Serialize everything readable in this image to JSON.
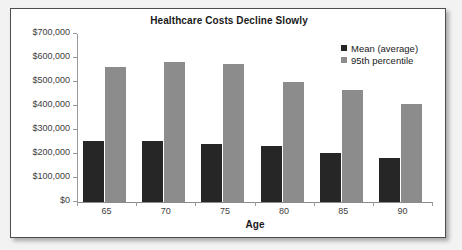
{
  "chart_data": {
    "type": "bar",
    "title": "Healthcare Costs Decline Slowly",
    "xlabel": "Age",
    "ylabel": "",
    "categories": [
      "65",
      "70",
      "75",
      "80",
      "85",
      "90"
    ],
    "series": [
      {
        "name": "Mean (average)",
        "color": "#262626",
        "values": [
          253000,
          253000,
          242000,
          233000,
          204000,
          183000
        ]
      },
      {
        "name": "95th percentile",
        "color": "#8c8c8c",
        "values": [
          563000,
          583000,
          575000,
          500000,
          467000,
          408000
        ]
      }
    ],
    "ylim": [
      0,
      700000
    ],
    "ytick_values": [
      0,
      100000,
      200000,
      300000,
      400000,
      500000,
      600000,
      700000
    ],
    "ytick_labels": [
      "$0",
      "$100,000",
      "$200,000",
      "$300,000",
      "$400,000",
      "$500,000",
      "$600,000",
      "$700,000"
    ],
    "grid": false,
    "legend_position": "top-right"
  },
  "figure": {
    "background_color": "#ffffff",
    "page_background_color": "#f2f2f2",
    "border_color": "#4d4d4d"
  }
}
